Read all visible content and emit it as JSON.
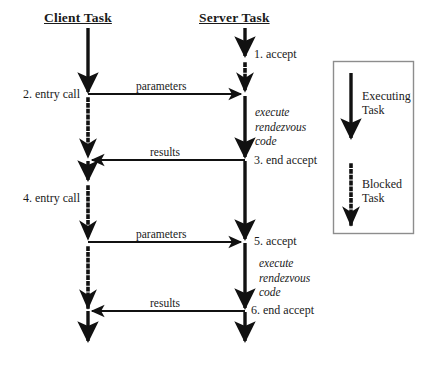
{
  "diagram": {
    "type": "sequence-diagram",
    "title_client": "Client Task",
    "title_server": "Server Task",
    "colors": {
      "line": "#111111",
      "text": "#1a1a1a",
      "legend_border": "#888888",
      "background": "#ffffff"
    },
    "lifelines": [
      {
        "name": "client",
        "label": "Client Task",
        "x": 88,
        "segments": [
          {
            "style": "solid",
            "from": 28,
            "to": 94
          },
          {
            "style": "dotted",
            "from": 94,
            "to": 160
          },
          {
            "style": "solid",
            "from": 160,
            "to": 182
          },
          {
            "style": "dotted",
            "from": 182,
            "to": 311
          },
          {
            "style": "solid",
            "from": 311,
            "to": 345
          }
        ]
      },
      {
        "name": "server",
        "label": "Server Task",
        "x": 245,
        "segments": [
          {
            "style": "solid",
            "from": 28,
            "to": 58
          },
          {
            "style": "dotted",
            "from": 58,
            "to": 94
          },
          {
            "style": "solid",
            "from": 94,
            "to": 345
          }
        ]
      }
    ],
    "messages": [
      {
        "name": "parameters-1",
        "label": "parameters",
        "y": 94,
        "direction": "client-to-server"
      },
      {
        "name": "results-1",
        "label": "results",
        "y": 160,
        "direction": "server-to-client"
      },
      {
        "name": "parameters-2",
        "label": "parameters",
        "y": 242,
        "direction": "client-to-server"
      },
      {
        "name": "results-2",
        "label": "results",
        "y": 311,
        "direction": "server-to-client"
      }
    ],
    "steps": [
      {
        "name": "step-1-accept",
        "label": "1. accept",
        "side": "server",
        "y": 56
      },
      {
        "name": "step-2-entry-call",
        "label": "2. entry call",
        "side": "client",
        "y": 96
      },
      {
        "name": "step-3-end-accept",
        "label": "3. end accept",
        "side": "server",
        "y": 162
      },
      {
        "name": "step-4-entry-call",
        "label": "4. entry call",
        "side": "client",
        "y": 200
      },
      {
        "name": "step-5-accept",
        "label": "5. accept",
        "side": "server",
        "y": 243
      },
      {
        "name": "step-6-end-accept",
        "label": "6. end accept",
        "side": "server",
        "y": 312
      }
    ],
    "rendezvous_notes": [
      {
        "name": "rendezvous-note-1",
        "line1": "execute",
        "line2": "rendezvous",
        "line3": "code",
        "y": 110
      },
      {
        "name": "rendezvous-note-2",
        "line1": "execute",
        "line2": "rendezvous",
        "line3": "code",
        "y": 262
      }
    ],
    "legend": {
      "name": "legend",
      "box": {
        "x": 333,
        "y": 61,
        "width": 81,
        "height": 173
      },
      "entries": [
        {
          "name": "legend-executing-task",
          "style": "solid",
          "line1": "Executing",
          "line2": "Task",
          "arrow_x": 351,
          "arrow_from": 73,
          "arrow_to": 143
        },
        {
          "name": "legend-blocked-task",
          "style": "dotted",
          "line1": "Blocked",
          "line2": "Task",
          "arrow_x": 351,
          "arrow_from": 165,
          "arrow_to": 228
        }
      ]
    }
  }
}
